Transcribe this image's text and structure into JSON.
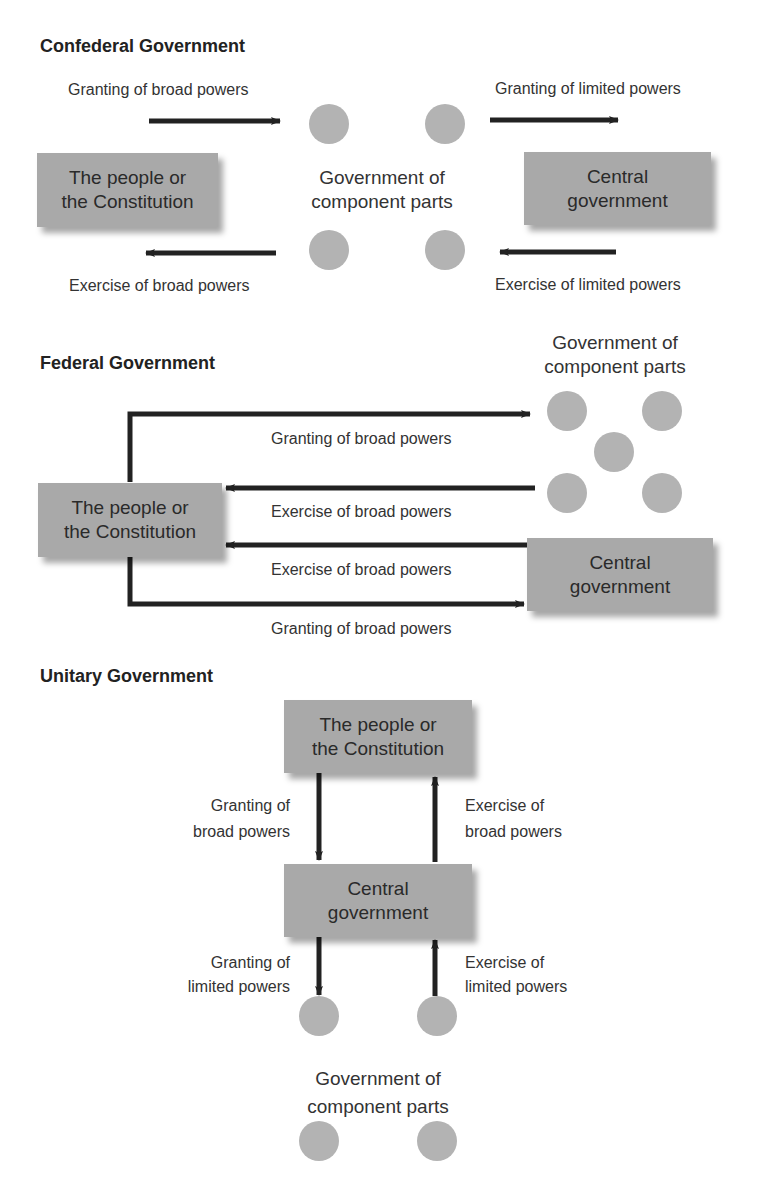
{
  "confederal": {
    "title": "Confederal Government",
    "people_box": [
      "The people or",
      "the Constitution"
    ],
    "component_label": [
      "Government of",
      "component parts"
    ],
    "central_box": [
      "Central",
      "government"
    ],
    "arrow_labels": {
      "top_left": "Granting of broad powers",
      "top_right": "Granting of limited powers",
      "bottom_left": "Exercise of broad powers",
      "bottom_right": "Exercise of limited powers"
    }
  },
  "federal": {
    "title": "Federal Government",
    "component_label": [
      "Government of",
      "component parts"
    ],
    "people_box": [
      "The people or",
      "the Constitution"
    ],
    "central_box": [
      "Central",
      "government"
    ],
    "arrow_labels": {
      "grant_to_component": "Granting of broad powers",
      "exercise_from_component": "Exercise of broad powers",
      "exercise_from_central": "Exercise of broad powers",
      "grant_to_central": "Granting of broad powers"
    }
  },
  "unitary": {
    "title": "Unitary Government",
    "people_box": [
      "The people or",
      "the Constitution"
    ],
    "central_box": [
      "Central",
      "government"
    ],
    "component_label": [
      "Government of",
      "component parts"
    ],
    "arrow_labels": {
      "grant_broad": [
        "Granting of",
        "broad powers"
      ],
      "exercise_broad": [
        "Exercise of",
        "broad powers"
      ],
      "grant_limited": [
        "Granting of",
        "limited powers"
      ],
      "exercise_limited": [
        "Exercise of",
        "limited powers"
      ]
    }
  },
  "colors": {
    "box_fill": "#a9a9a9",
    "circle_fill": "#b3b3b3",
    "arrow": "#222222",
    "text": "#333333"
  }
}
